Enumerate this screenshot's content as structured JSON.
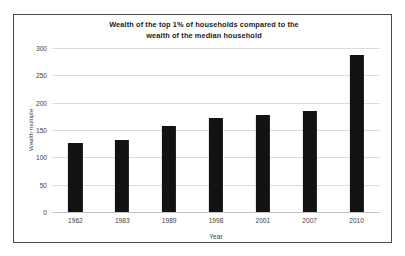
{
  "chart_data": {
    "type": "bar",
    "title": "Wealth of the top 1% of households compared to the wealth of the median household",
    "title_lines": [
      "Wealth of the top 1% of households compared to the",
      "wealth of the median household"
    ],
    "categories": [
      "1962",
      "1983",
      "1989",
      "1998",
      "2001",
      "2007",
      "2010"
    ],
    "values": [
      125,
      131,
      156,
      171,
      176,
      184,
      287
    ],
    "series": [
      {
        "name": "Wealth multiple",
        "values": [
          125,
          131,
          156,
          171,
          176,
          184,
          287
        ]
      }
    ],
    "xlabel": "Year",
    "ylabel": "Wealth multiple",
    "ylim": [
      0,
      300
    ],
    "yticks": [
      0,
      50,
      100,
      150,
      200,
      250,
      300
    ],
    "ytick_labels": [
      "0",
      "50",
      "100",
      "150",
      "200",
      "250",
      "300"
    ],
    "grid": "horizontal",
    "legend": "none",
    "bar_color": "#121212",
    "gridline_color": "#dcdcdc",
    "frame_color": "#4a4a4a",
    "background": "#ffffff"
  }
}
